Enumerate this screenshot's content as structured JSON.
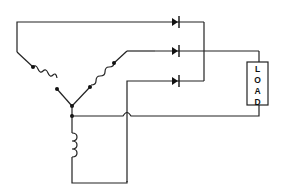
{
  "diagram": {
    "type": "circuit-schematic",
    "load": {
      "label": "LOAD",
      "letters": [
        "L",
        "O",
        "A",
        "D"
      ]
    },
    "components": {
      "wye_windings": 3,
      "diodes": 3,
      "neutral_inductor": 1,
      "load": 1,
      "junction_dots": 2,
      "wire_crossover_hop": 1
    },
    "colors": {
      "line": "#222222",
      "background": "#ffffff"
    }
  }
}
